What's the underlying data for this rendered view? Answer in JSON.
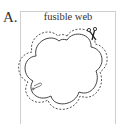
{
  "figure": {
    "panel_label": "A.",
    "title": "fusible web",
    "shape": "five-lobed flower outline",
    "outer_line_style": "dashed cut line",
    "icons": [
      "scissors-icon",
      "safety-pin-icon"
    ],
    "colors": {
      "line": "#444444",
      "frame": "#cfcfcf",
      "text": "#333333"
    }
  }
}
